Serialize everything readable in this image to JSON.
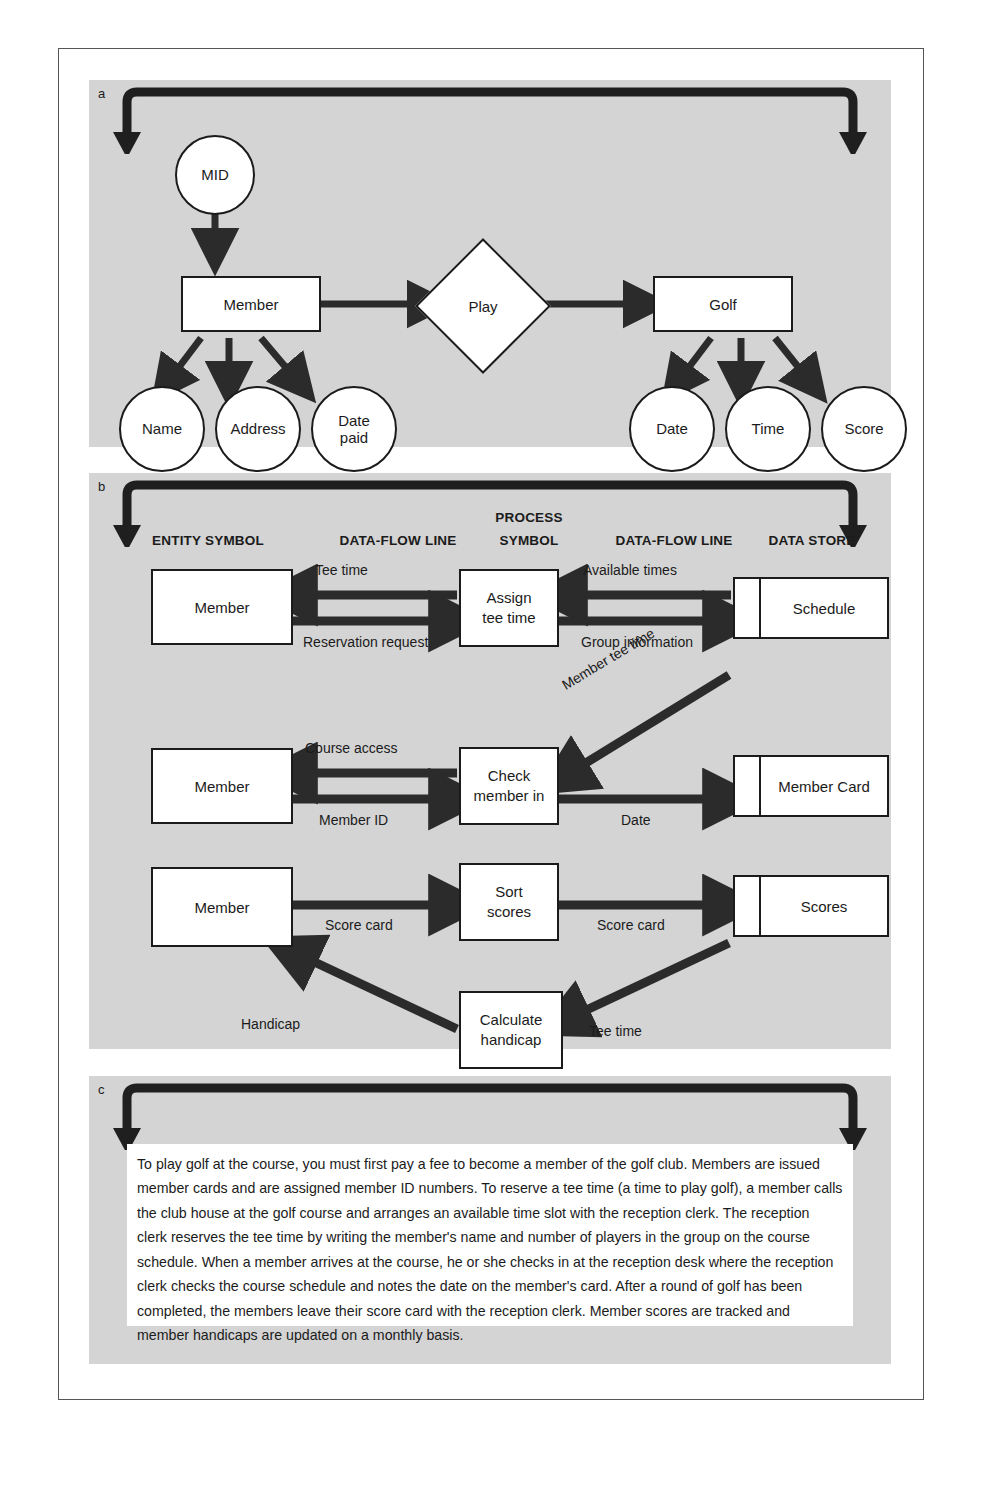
{
  "figure": {
    "panels": [
      {
        "label": "a",
        "kind": "entity-relationship-diagram"
      },
      {
        "label": "b",
        "kind": "data-flow-diagram"
      },
      {
        "label": "c",
        "kind": "narrative-description"
      }
    ]
  },
  "panel_a": {
    "label": "a",
    "nodes": {
      "mid": "MID",
      "member": "Member",
      "play": "Play",
      "golf": "Golf",
      "name": "Name",
      "address": "Address",
      "date_paid": "Date\npaid",
      "date_paid_line1": "Date",
      "date_paid_line2": "paid",
      "date": "Date",
      "time": "Time",
      "score": "Score"
    }
  },
  "panel_b": {
    "label": "b",
    "column_headers": [
      "ENTITY SYMBOL",
      "DATA-FLOW LINE",
      "PROCESS SYMBOL",
      "DATA-FLOW LINE",
      "DATA STORE"
    ],
    "header_process_line1": "PROCESS",
    "header_process_line2": "SYMBOL",
    "rows": [
      {
        "entity": "Member",
        "process_line1": "Assign",
        "process_line2": "tee time",
        "datastore": "Schedule",
        "flow_left_top": "Tee time",
        "flow_left_bottom": "Reservation request",
        "flow_right_top": "Available times",
        "flow_right_bottom": "Group information"
      },
      {
        "entity": "Member",
        "process_line1": "Check",
        "process_line2": "member in",
        "datastore": "Member Card",
        "flow_left_top": "Course access",
        "flow_left_bottom": "Member ID",
        "flow_right_bottom": "Date",
        "flow_diagonal": "Member tee time"
      },
      {
        "entity": "Member",
        "process_line1": "Sort",
        "process_line2": "scores",
        "datastore": "Scores",
        "flow_left": "Score card",
        "flow_right": "Score card",
        "process2_line1": "Calculate",
        "process2_line2": "handicap",
        "flow_handicap": "Handicap",
        "flow_tee_time": "Tee time"
      }
    ]
  },
  "panel_c": {
    "label": "c",
    "paragraph": "To play golf at the course, you must first pay a fee to become a member of the golf club. Members are issued member cards and are assigned member ID numbers. To reserve a tee time (a time to play golf), a member calls the club house at the golf course and arranges an available time slot with the reception clerk. The reception clerk reserves the tee time by writing the member's name and number of players in the group on the course schedule. When a member arrives at the course, he or she checks in at the reception desk where the reception clerk checks the course schedule and notes the date on the member's card. After a round of golf has been completed, the members leave their score card with the reception clerk. Member scores are tracked and member handicaps are updated on a monthly basis."
  },
  "colors": {
    "panel_background": "#d4d4d4",
    "panel_shadow": "#8d8d8d",
    "shape_fill": "#ffffff",
    "shape_outline": "#1b1b1b",
    "shape_shadow": "#3a3a3a",
    "arrow_fill": "#2b2b2b",
    "page_background": "#ffffff",
    "text": "#1b1b1b"
  }
}
